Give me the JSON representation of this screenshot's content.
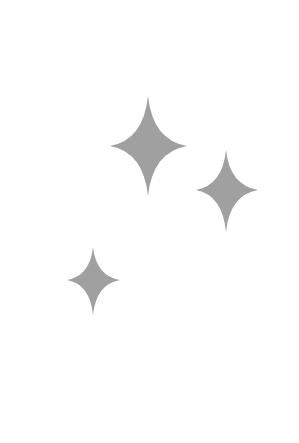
{
  "canvas": {
    "width": 299,
    "height": 443,
    "background": "#ffffff"
  },
  "sparkles": [
    {
      "icon": "sparkle-icon",
      "size": "large",
      "center_x": 148,
      "center_y": 146,
      "top": 96,
      "bottom": 196,
      "left": 110,
      "right": 187,
      "color": "#a0a0a0"
    },
    {
      "icon": "sparkle-icon",
      "size": "medium",
      "center_x": 226,
      "center_y": 190,
      "top": 150,
      "bottom": 232,
      "left": 196,
      "right": 258,
      "color": "#a0a0a0"
    },
    {
      "icon": "sparkle-icon",
      "size": "small",
      "center_x": 93,
      "center_y": 280,
      "top": 247,
      "bottom": 315,
      "left": 67,
      "right": 120,
      "color": "#a0a0a0"
    }
  ]
}
